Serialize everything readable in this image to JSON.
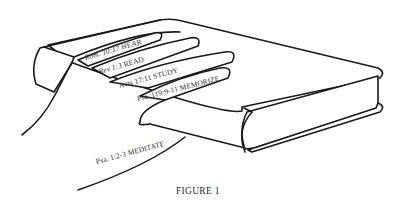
{
  "figure": {
    "caption": "FIGURE 1",
    "stroke_color": "#1a1a1a",
    "background_color": "#ffffff",
    "fingers": [
      {
        "name": "little-finger",
        "reference": "Rom. 10:17",
        "label": "HEAR"
      },
      {
        "name": "ring-finger",
        "reference": "Rev 1:3",
        "label": "READ"
      },
      {
        "name": "middle-finger",
        "reference": "Acts 17:11",
        "label": "STUDY"
      },
      {
        "name": "index-finger",
        "reference": "Psa. 119:9-11",
        "label": "MEMORIZE"
      },
      {
        "name": "thumb",
        "reference": "Psa. 1:2-3",
        "label": "MEDITATE"
      }
    ]
  }
}
